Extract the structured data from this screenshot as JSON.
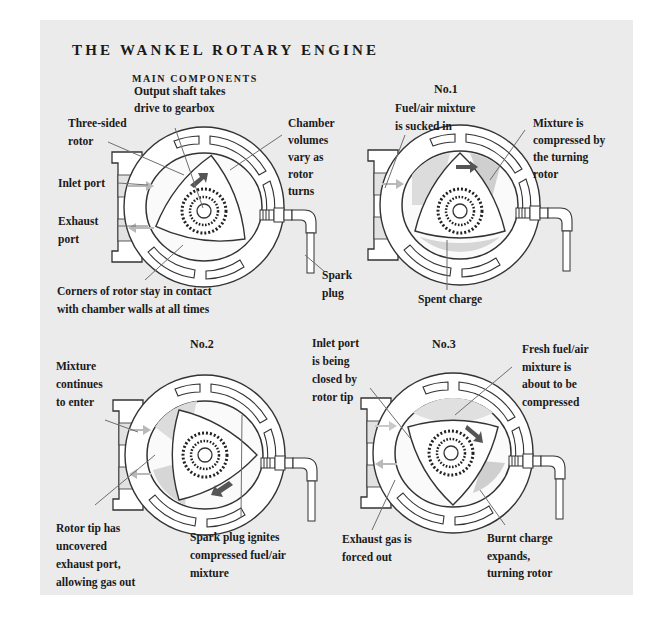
{
  "title": "THE WANKEL ROTARY ENGINE",
  "subtitle": "MAIN COMPONENTS",
  "colors": {
    "panel_background": "#ebebeb",
    "text": "#1a1a1a",
    "housing_fill": "#ffffff",
    "outline": "#333333",
    "arrow_dark": "#555555",
    "arrow_light": "#b9b9b9",
    "shade": "#d2d2d2"
  },
  "main_components": {
    "labels": {
      "three_sided_rotor": "Three-sided\nrotor",
      "output_shaft": "Output shaft takes\ndrive to gearbox",
      "chamber_volumes": "Chamber\nvolumes\nvary as\nrotor\nturns",
      "inlet_port": "Inlet port",
      "exhaust_port": "Exhaust\nport",
      "spark_plug": "Spark\nplug",
      "corners": "Corners of rotor stay in contact\nwith chamber walls at all times"
    }
  },
  "stages": [
    {
      "number": "No.1",
      "labels": {
        "intake": "Fuel/air mixture\nis sucked in",
        "compression": "Mixture is\ncompressed by\nthe turning\nrotor",
        "spent": "Spent charge"
      }
    },
    {
      "number": "No.2",
      "labels": {
        "continues": "Mixture\ncontinues\nto enter",
        "rotor_tip": "Rotor tip has\nuncovered\nexhaust port,\nallowing gas out",
        "ignition": "Spark plug ignites\ncompressed fuel/air\nmixture"
      }
    },
    {
      "number": "No.3",
      "labels": {
        "inlet_closing": "Inlet port\nis being\nclosed by\nrotor tip",
        "fresh_mixture": "Fresh fuel/air\nmixture is\nabout to be\ncompressed",
        "exhaust_forced": "Exhaust gas is\nforced out",
        "burnt_charge": "Burnt charge\nexpands,\nturning rotor"
      }
    }
  ]
}
